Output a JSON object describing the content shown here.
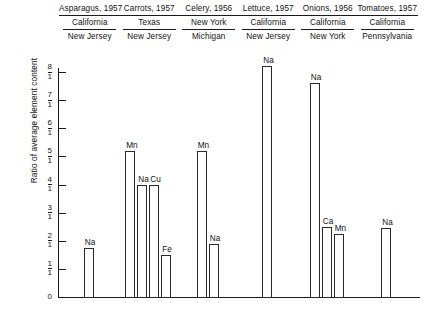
{
  "figure": {
    "y_axis_title": "Ratio of average element content",
    "y_ticks": [
      {
        "num": "8",
        "den": "1",
        "value": 8
      },
      {
        "num": "7",
        "den": "1",
        "value": 7
      },
      {
        "num": "6",
        "den": "1",
        "value": 6
      },
      {
        "num": "5",
        "den": "1",
        "value": 5
      },
      {
        "num": "4",
        "den": "1",
        "value": 4
      },
      {
        "num": "3",
        "den": "1",
        "value": 3
      },
      {
        "num": "2",
        "den": "1",
        "value": 2
      },
      {
        "num": "1",
        "den": "1",
        "value": 1
      },
      {
        "num": "0",
        "den": "",
        "value": 0
      }
    ],
    "zero_label": "0"
  },
  "groups": [
    {
      "title": "Asparagus, 1957",
      "numerator": "California",
      "denominator": "New Jersey",
      "bars": [
        {
          "label": "Na",
          "value": 1.75
        }
      ]
    },
    {
      "title": "Carrots, 1957",
      "numerator": "Texas",
      "denominator": "New Jersey",
      "bars": [
        {
          "label": "Mn",
          "value": 5.2
        },
        {
          "label": "Na",
          "value": 4.0
        },
        {
          "label": "Cu",
          "value": 4.0
        },
        {
          "label": "Fe",
          "value": 1.5
        }
      ]
    },
    {
      "title": "Celery, 1956",
      "numerator": "New York",
      "denominator": "Michigan",
      "bars": [
        {
          "label": "Mn",
          "value": 5.2
        },
        {
          "label": "Na",
          "value": 1.9
        }
      ]
    },
    {
      "title": "Lettuce, 1957",
      "numerator": "California",
      "denominator": "New Jersey",
      "bars": [
        {
          "label": "Na",
          "value": 8.2
        }
      ]
    },
    {
      "title": "Onions, 1956",
      "numerator": "California",
      "denominator": "New York",
      "bars": [
        {
          "label": "Na",
          "value": 7.6
        },
        {
          "label": "Ca",
          "value": 2.5
        },
        {
          "label": "Mn",
          "value": 2.25
        }
      ]
    },
    {
      "title": "Tomatoes, 1957",
      "numerator": "California",
      "denominator": "Pennsylvania",
      "bars": [
        {
          "label": "Na",
          "value": 2.45
        }
      ]
    }
  ],
  "chart_data": {
    "type": "bar",
    "title": "",
    "xlabel": "",
    "ylabel": "Ratio of average element content",
    "ylim": [
      0,
      8.5
    ],
    "ytick_labels": [
      "0",
      "1/1",
      "2/1",
      "3/1",
      "4/1",
      "5/1",
      "6/1",
      "7/1",
      "8/1"
    ],
    "ytick_values": [
      0,
      1,
      2,
      3,
      4,
      5,
      6,
      7,
      8
    ],
    "grid": false,
    "legend": "none",
    "group_header_rows": [
      "crop_year",
      "numerator_state",
      "denominator_state"
    ],
    "categories": [
      "Asparagus, 1957 California/New Jersey",
      "Carrots, 1957 Texas/New Jersey",
      "Celery, 1956 New York/Michigan",
      "Lettuce, 1957 California/New Jersey",
      "Onions, 1956 California/New York",
      "Tomatoes, 1957 California/Pennsylvania"
    ],
    "points": [
      {
        "group": "Asparagus, 1957",
        "numerator": "California",
        "denominator": "New Jersey",
        "element": "Na",
        "value": 1.75
      },
      {
        "group": "Carrots, 1957",
        "numerator": "Texas",
        "denominator": "New Jersey",
        "element": "Mn",
        "value": 5.2
      },
      {
        "group": "Carrots, 1957",
        "numerator": "Texas",
        "denominator": "New Jersey",
        "element": "Na",
        "value": 4.0
      },
      {
        "group": "Carrots, 1957",
        "numerator": "Texas",
        "denominator": "New Jersey",
        "element": "Cu",
        "value": 4.0
      },
      {
        "group": "Carrots, 1957",
        "numerator": "Texas",
        "denominator": "New Jersey",
        "element": "Fe",
        "value": 1.5
      },
      {
        "group": "Celery, 1956",
        "numerator": "New York",
        "denominator": "Michigan",
        "element": "Mn",
        "value": 5.2
      },
      {
        "group": "Celery, 1956",
        "numerator": "New York",
        "denominator": "Michigan",
        "element": "Na",
        "value": 1.9
      },
      {
        "group": "Lettuce, 1957",
        "numerator": "California",
        "denominator": "New Jersey",
        "element": "Na",
        "value": 8.2
      },
      {
        "group": "Onions, 1956",
        "numerator": "California",
        "denominator": "New York",
        "element": "Na",
        "value": 7.6
      },
      {
        "group": "Onions, 1956",
        "numerator": "California",
        "denominator": "New York",
        "element": "Ca",
        "value": 2.5
      },
      {
        "group": "Onions, 1956",
        "numerator": "California",
        "denominator": "New York",
        "element": "Mn",
        "value": 2.25
      },
      {
        "group": "Tomatoes, 1957",
        "numerator": "California",
        "denominator": "Pennsylvania",
        "element": "Na",
        "value": 2.45
      }
    ]
  }
}
